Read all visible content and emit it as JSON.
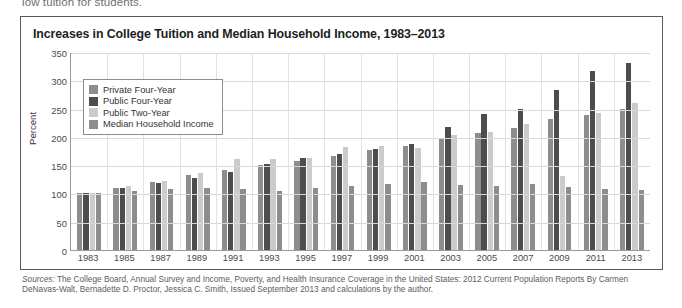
{
  "page": {
    "preceding_text": "low tuition for students."
  },
  "figure": {
    "title": "Increases in College Tuition and Median Household Income, 1983–2013",
    "sources_prefix": "Sources:",
    "sources_text": " The College Board, Annual Survey and Income, Poverty, and Health Insurance Coverage in the United States: 2012 Current Population Reports By Carmen DeNavas-Walt, Bernadette D. Proctor, Jessica C. Smith, Issued September 2013 and calculations by the author."
  },
  "colors": {
    "private_four_year": "#8d8d8d",
    "public_four_year": "#4d4d4d",
    "public_two_year": "#cbcbcb",
    "median_household_income": "#8d8d8d",
    "frame": "#5a5a5a",
    "grid": "#d8d8d8",
    "axis": "#9a9a9a"
  },
  "chart_data": {
    "type": "bar",
    "title": "Increases in College Tuition and Median Household Income, 1983–2013",
    "xlabel": "",
    "ylabel": "Percent",
    "ylim": [
      0,
      350
    ],
    "yticks": [
      0,
      50,
      100,
      150,
      200,
      250,
      300,
      350
    ],
    "grid": true,
    "legend_position": "top-left-inside",
    "categories": [
      "1983",
      "1985",
      "1987",
      "1989",
      "1991",
      "1993",
      "1995",
      "1997",
      "1999",
      "2001",
      "2003",
      "2005",
      "2007",
      "2009",
      "2011",
      "2013"
    ],
    "series": [
      {
        "name": "Private Four-Year",
        "color": "#8d8d8d",
        "values": [
          100,
          110,
          120,
          132,
          142,
          150,
          158,
          166,
          176,
          184,
          197,
          207,
          216,
          232,
          238,
          250
        ]
      },
      {
        "name": "Public Four-Year",
        "color": "#4d4d4d",
        "values": [
          100,
          110,
          118,
          127,
          138,
          152,
          162,
          170,
          178,
          188,
          217,
          241,
          250,
          283,
          317,
          330
        ]
      },
      {
        "name": "Public Two-Year",
        "color": "#cbcbcb",
        "values": [
          100,
          114,
          122,
          137,
          161,
          161,
          163,
          182,
          183,
          180,
          203,
          208,
          223,
          130,
          243,
          260
        ]
      },
      {
        "name": "Median Household Income",
        "color": "#8d8d8d",
        "values": [
          100,
          104,
          107,
          110,
          107,
          105,
          110,
          113,
          117,
          121,
          115,
          114,
          117,
          112,
          108,
          106
        ]
      }
    ]
  }
}
